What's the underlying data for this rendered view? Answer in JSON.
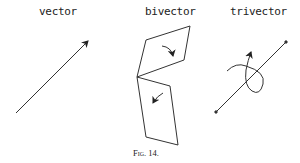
{
  "figure": {
    "labels": {
      "vector": "vector",
      "bivector": "bivector",
      "trivector": "trivector"
    },
    "caption": "Fig. 14.",
    "stroke_color": "#222222"
  }
}
